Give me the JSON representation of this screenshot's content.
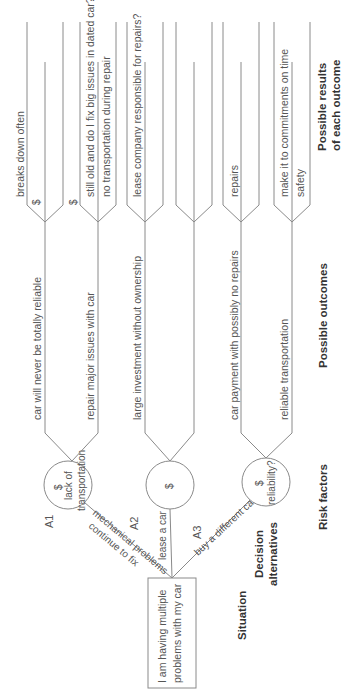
{
  "situation": {
    "label": "Situation",
    "text_line1": "I am having multiple",
    "text_line2": "problems with my car"
  },
  "column_labels": {
    "decision_line1": "Decision",
    "decision_line2": "alternatives",
    "risk": "Risk factors",
    "outcomes": "Possible outcomes",
    "results_line1": "Possible results",
    "results_line2": "of each outcome"
  },
  "alternatives": [
    {
      "id": "A1",
      "label_line1": "continue to fix",
      "label_line2": "mechanical problems",
      "risk": {
        "symbol": "$",
        "line1": "lack of",
        "line2": "transportation"
      },
      "outcomes": [
        {
          "text": "car will never be totally reliable",
          "results": [
            {
              "symbol": "$",
              "text": "breaks down often"
            }
          ]
        },
        {
          "text": "repair major issues with car",
          "results": [
            {
              "symbol": "$",
              "text": "still old and do I fix big issues in dated car?"
            },
            {
              "symbol": "",
              "text": "no transportation during repair"
            }
          ]
        }
      ]
    },
    {
      "id": "A2",
      "label_line1": "lease a car",
      "risk": {
        "symbol": "$"
      },
      "outcomes": [
        {
          "text": "large investment without ownership",
          "results": [
            {
              "symbol": "",
              "text": "lease company responsible for repairs?"
            }
          ]
        },
        {
          "text": "",
          "results": [
            {
              "symbol": "",
              "text": ""
            }
          ]
        }
      ]
    },
    {
      "id": "A3",
      "label_line1": "buy a different car",
      "risk": {
        "symbol": "$",
        "line1": "reliability?"
      },
      "outcomes": [
        {
          "text": "car payment with possibly no repairs",
          "results": [
            {
              "symbol": "",
              "text": "repairs"
            }
          ]
        },
        {
          "text": "reliable transportation",
          "results": [
            {
              "symbol": "",
              "text": "make it to commitments on time"
            },
            {
              "symbol": "",
              "text": "safety"
            }
          ]
        }
      ]
    }
  ]
}
